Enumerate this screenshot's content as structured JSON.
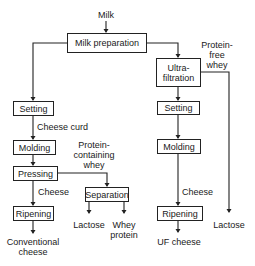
{
  "diagram": {
    "input": "Milk",
    "nodes": {
      "milk_preparation": "Milk preparation",
      "ultrafiltration": "Ultra-\nfiltration",
      "setting_left": "Setting",
      "molding_left": "Molding",
      "pressing": "Pressing",
      "ripening_left": "Ripening",
      "separation": "Separation",
      "setting_right": "Setting",
      "molding_right": "Molding",
      "ripening_right": "Ripening"
    },
    "labels": {
      "cheese_curd": "Cheese curd",
      "protein_containing_whey": "Protein-\ncontaining\nwhey",
      "cheese_left": "Cheese",
      "conventional_cheese": "Conventional\ncheese",
      "lactose_left": "Lactose",
      "whey_protein": "Whey\nprotein",
      "protein_free_whey": "Protein-\nfree\nwhey",
      "cheese_right": "Cheese",
      "uf_cheese": "UF cheese",
      "lactose_right": "Lactose"
    }
  }
}
